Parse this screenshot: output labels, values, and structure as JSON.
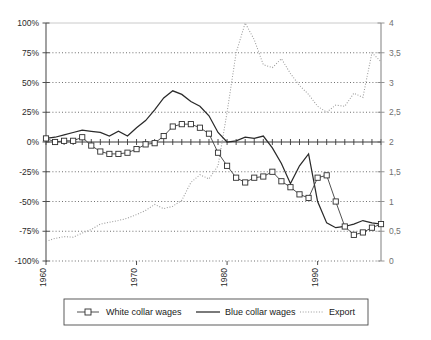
{
  "chart_data": {
    "type": "line",
    "title": "",
    "subtitle": "",
    "xlabel": "",
    "ylabel": "",
    "y2label": "",
    "grid": true,
    "legend_position": "bottom",
    "x": [
      1960,
      1961,
      1962,
      1963,
      1964,
      1965,
      1966,
      1967,
      1968,
      1969,
      1970,
      1971,
      1972,
      1973,
      1974,
      1975,
      1976,
      1977,
      1978,
      1979,
      1980,
      1981,
      1982,
      1983,
      1984,
      1985,
      1986,
      1987,
      1988,
      1989,
      1990,
      1991,
      1992,
      1993,
      1994,
      1995,
      1996,
      1997
    ],
    "x_tick_labels": [
      "1960",
      "1970",
      "1980",
      "1990"
    ],
    "x_tick_values": [
      1960,
      1970,
      1980,
      1990
    ],
    "axes": {
      "left": {
        "ticks": [
          "100%",
          "75%",
          "50%",
          "25%",
          "0%",
          "-25%",
          "-50%",
          "-75%",
          "-100%"
        ],
        "values": [
          100,
          75,
          50,
          25,
          0,
          -25,
          -50,
          -75,
          -100
        ],
        "min": -100,
        "max": 100
      },
      "right": {
        "ticks": [
          "4",
          "3,5",
          "3",
          "2,5",
          "2",
          "1,5",
          "1",
          "0,5",
          "0"
        ],
        "values": [
          4,
          3.5,
          3,
          2.5,
          2,
          1.5,
          1,
          0.5,
          0
        ],
        "min": 0,
        "max": 4
      }
    },
    "series": [
      {
        "name": "White collar wages",
        "axis": "left",
        "unit": "%",
        "marker": "square",
        "style": "line-marker",
        "color": "#2e2e2e",
        "values": [
          3,
          0,
          1,
          1,
          4,
          -3,
          -8,
          -10,
          -10,
          -9,
          -6,
          -2,
          -1,
          5,
          13,
          15,
          15,
          12,
          7,
          -9,
          -20,
          -30,
          -34,
          -30,
          -29,
          -25,
          -33,
          -38,
          -44,
          -47,
          -30,
          -28,
          -50,
          -71,
          -78,
          -76,
          -72,
          -69
        ]
      },
      {
        "name": "Blue collar wages",
        "axis": "left",
        "marker": "none",
        "style": "solid",
        "color": "#2a2a2a",
        "values": [
          3,
          4,
          6,
          8,
          10,
          9,
          8,
          5,
          9,
          5,
          12,
          18,
          27,
          37,
          43,
          40,
          34,
          30,
          22,
          8,
          0,
          1,
          4,
          3,
          5,
          -5,
          -18,
          -35,
          -20,
          -10,
          -50,
          -68,
          -72,
          -71,
          -69,
          -66,
          -68,
          -69
        ]
      },
      {
        "name": "Export",
        "axis": "right",
        "marker": "none",
        "style": "dotted",
        "color": "#9a9a9a",
        "values": [
          0.33,
          0.38,
          0.41,
          0.4,
          0.47,
          0.53,
          0.62,
          0.65,
          0.68,
          0.72,
          0.78,
          0.85,
          0.95,
          0.88,
          0.92,
          1.02,
          1.32,
          1.45,
          1.38,
          1.6,
          2.5,
          3.5,
          4,
          3.72,
          3.3,
          3.25,
          3.4,
          3.15,
          2.95,
          2.8,
          2.6,
          2.5,
          2.62,
          2.6,
          2.82,
          2.75,
          3.5,
          3.35
        ]
      }
    ],
    "legend": [
      {
        "label": "White collar wages",
        "marker": "square-line"
      },
      {
        "label": "Blue collar wages",
        "marker": "solid-line"
      },
      {
        "label": "Export",
        "marker": "dotted-line"
      }
    ]
  }
}
